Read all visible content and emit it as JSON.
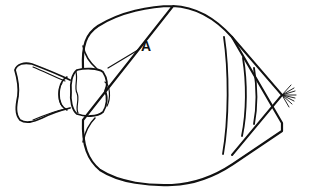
{
  "diagram": {
    "type": "biological-illustration",
    "labels": [
      {
        "id": "A",
        "text": "A",
        "points_to": "junction between head capsule and body"
      }
    ],
    "parts": [
      "head-lobed-segment",
      "neck-capsule",
      "rounded-body",
      "abdominal-segment-bands",
      "conical-tip",
      "terminal-bristles"
    ],
    "colors": {
      "stroke": "#111111",
      "background": "#ffffff"
    }
  }
}
